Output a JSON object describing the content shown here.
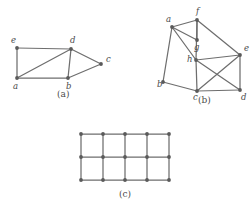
{
  "figure": {
    "background_color": "#ffffff",
    "stroke_color": "#6e6e6e",
    "node_color": "#5a5a5a",
    "label_color": "#4a4a4a",
    "panels": [
      {
        "id": "panel-a",
        "caption": "(a)",
        "caption_pos": {
          "x": 57,
          "y": 97
        },
        "type": "undirected-graph",
        "vertex_count": 5,
        "edge_count": 7,
        "vertices": [
          {
            "name": "e",
            "x": 17,
            "y": 48,
            "label_x": 11,
            "label_y": 43
          },
          {
            "name": "d",
            "x": 71,
            "y": 49,
            "label_x": 70,
            "label_y": 43
          },
          {
            "name": "a",
            "x": 17,
            "y": 78,
            "label_x": 13,
            "label_y": 89
          },
          {
            "name": "b",
            "x": 68,
            "y": 78,
            "label_x": 66,
            "label_y": 89
          },
          {
            "name": "c",
            "x": 101,
            "y": 64,
            "label_x": 106,
            "label_y": 62
          }
        ],
        "edges": [
          [
            "e",
            "d"
          ],
          [
            "e",
            "a"
          ],
          [
            "a",
            "d"
          ],
          [
            "a",
            "b"
          ],
          [
            "d",
            "b"
          ],
          [
            "d",
            "c"
          ],
          [
            "b",
            "c"
          ]
        ]
      },
      {
        "id": "panel-b",
        "caption": "(b)",
        "caption_pos": {
          "x": 198,
          "y": 103
        },
        "type": "undirected-graph",
        "vertex_count": 8,
        "edge_count": 13,
        "vertices": [
          {
            "name": "a",
            "x": 172,
            "y": 27,
            "label_x": 166,
            "label_y": 22
          },
          {
            "name": "f",
            "x": 197,
            "y": 20,
            "label_x": 196,
            "label_y": 14
          },
          {
            "name": "g",
            "x": 197,
            "y": 40,
            "label_x": 194,
            "label_y": 50
          },
          {
            "name": "h",
            "x": 196,
            "y": 60,
            "label_x": 187,
            "label_y": 62
          },
          {
            "name": "e",
            "x": 240,
            "y": 55,
            "label_x": 244,
            "label_y": 51
          },
          {
            "name": "b",
            "x": 163,
            "y": 82,
            "label_x": 157,
            "label_y": 87
          },
          {
            "name": "c",
            "x": 197,
            "y": 91,
            "label_x": 193,
            "label_y": 100
          },
          {
            "name": "d",
            "x": 240,
            "y": 90,
            "label_x": 241,
            "label_y": 100
          }
        ],
        "edges": [
          [
            "a",
            "f"
          ],
          [
            "a",
            "g"
          ],
          [
            "a",
            "h"
          ],
          [
            "a",
            "b"
          ],
          [
            "f",
            "g"
          ],
          [
            "f",
            "h"
          ],
          [
            "f",
            "e"
          ],
          [
            "h",
            "e"
          ],
          [
            "h",
            "c"
          ],
          [
            "h",
            "d"
          ],
          [
            "e",
            "c"
          ],
          [
            "e",
            "d"
          ],
          [
            "c",
            "d"
          ],
          [
            "b",
            "c"
          ]
        ]
      },
      {
        "id": "panel-c",
        "caption": "(c)",
        "caption_pos": {
          "x": 119,
          "y": 197
        },
        "type": "grid-graph",
        "grid_cols": 5,
        "grid_rows": 3,
        "vertex_count": 15,
        "edge_count": 22,
        "x_start": 81,
        "y_start": 134,
        "x_step": 22,
        "y_step": 23
      }
    ]
  }
}
